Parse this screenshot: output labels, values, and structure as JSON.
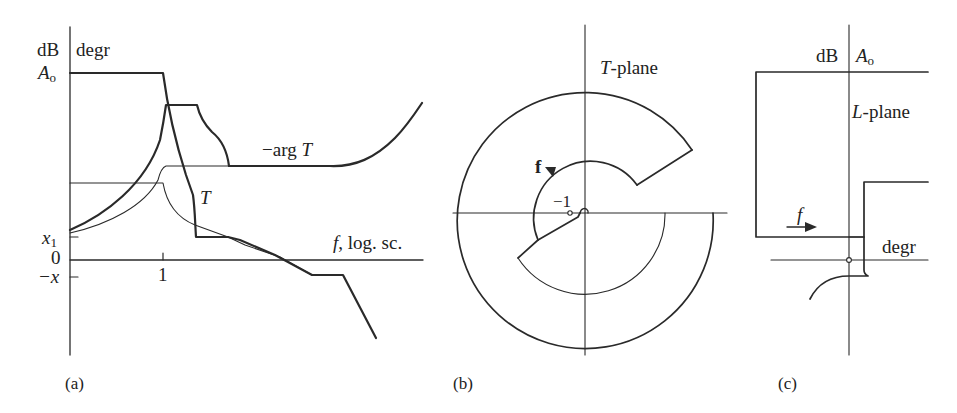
{
  "figure": {
    "panels": [
      {
        "id": "a",
        "caption": "(a)",
        "y_axis_labels": {
          "unit_left": "dB",
          "unit_right": "degr"
        },
        "y_ticks": [
          {
            "label": "A",
            "subscript": "o"
          },
          {
            "label": "x",
            "subscript": "1"
          },
          {
            "label": "0"
          },
          {
            "label": "−x"
          }
        ],
        "x_tick": "1",
        "x_axis_label": "f, log. sc.",
        "x_axis_label_italic_part": "f",
        "x_axis_label_rest": ", log. sc.",
        "curve_labels": {
          "phase": "−arg T",
          "phase_prefix": "−arg ",
          "phase_var": "T",
          "gain": "T"
        }
      },
      {
        "id": "b",
        "caption": "(b)",
        "plane_label": "T-plane",
        "plane_label_var": "T",
        "plane_label_rest": "-plane",
        "point_label": "−1",
        "direction_label": "f"
      },
      {
        "id": "c",
        "caption": "(c)",
        "axis_labels": {
          "unit": "dB",
          "top": "A",
          "top_sub": "o",
          "horizontal": "degr"
        },
        "plane_label_var": "L",
        "plane_label_rest": "-plane",
        "direction_label": "f"
      }
    ]
  }
}
